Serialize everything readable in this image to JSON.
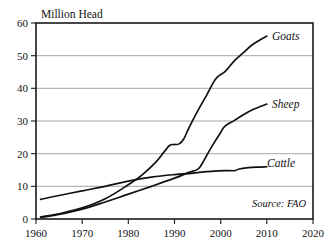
{
  "chart_data": {
    "type": "line",
    "title": "Million Head",
    "xlabel": "",
    "ylabel": "Million Head",
    "xlim": [
      1960,
      2020
    ],
    "ylim": [
      0,
      60
    ],
    "x_ticks": [
      1960,
      1970,
      1980,
      1990,
      2000,
      2010,
      2020
    ],
    "y_ticks": [
      0,
      10,
      20,
      30,
      40,
      50,
      60
    ],
    "grid": "horizontal",
    "legend_position": "inline-right-of-line-end",
    "annotations": [
      "Source: FAO"
    ],
    "source": "Source: FAO",
    "series": [
      {
        "name": "Goats",
        "label": "Goats",
        "x": [
          1961,
          1965,
          1970,
          1975,
          1980,
          1983,
          1986,
          1988,
          1989,
          1990,
          1991,
          1992,
          1993,
          1995,
          1997,
          1999,
          2001,
          2003,
          2005,
          2007,
          2010
        ],
        "values": [
          0.6,
          1.6,
          3.4,
          6.2,
          10.5,
          13.5,
          17.5,
          21.0,
          22.6,
          22.8,
          23.0,
          24.5,
          27.5,
          33.0,
          38.0,
          43.0,
          45.2,
          48.5,
          51.0,
          53.5,
          56.0
        ]
      },
      {
        "name": "Sheep",
        "label": "Sheep",
        "x": [
          1961,
          1965,
          1970,
          1975,
          1980,
          1985,
          1990,
          1993,
          1995,
          1996,
          1998,
          2000,
          2001,
          2003,
          2005,
          2007,
          2010
        ],
        "values": [
          0.5,
          1.4,
          3.0,
          5.2,
          7.6,
          10.0,
          12.5,
          14.2,
          15.2,
          17.0,
          22.0,
          26.5,
          28.5,
          30.2,
          32.0,
          33.5,
          35.2
        ]
      },
      {
        "name": "Cattle",
        "label": "Cattle",
        "x": [
          1961,
          1965,
          1970,
          1975,
          1980,
          1985,
          1990,
          1993,
          1995,
          1998,
          2001,
          2003,
          2004,
          2006,
          2008,
          2010
        ],
        "values": [
          6.0,
          7.2,
          8.6,
          10.0,
          11.6,
          12.8,
          13.6,
          13.9,
          14.2,
          14.6,
          14.8,
          14.8,
          15.3,
          15.7,
          15.9,
          16.0
        ]
      }
    ]
  },
  "labels": {
    "y_axis_title": "Million Head",
    "goats": "Goats",
    "sheep": "Sheep",
    "cattle": "Cattle",
    "source": "Source: FAO",
    "y_0": "0",
    "y_10": "10",
    "y_20": "20",
    "y_30": "30",
    "y_40": "40",
    "y_50": "50",
    "y_60": "60",
    "x_1960": "1960",
    "x_1970": "1970",
    "x_1980": "1980",
    "x_1990": "1990",
    "x_2000": "2000",
    "x_2010": "2010",
    "x_2020": "2020"
  },
  "colors": {
    "line": "#111111",
    "grid": "#8d8d8d",
    "frame": "#1a1a1a",
    "text": "#121212",
    "background": "#ffffff"
  }
}
